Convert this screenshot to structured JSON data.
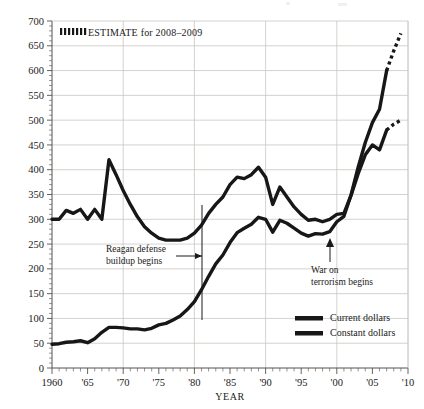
{
  "chart_data": {
    "type": "line",
    "title": "",
    "xlabel": "YEAR",
    "ylabel": "BILLIONS OF DOLLARS",
    "xlim": [
      1960,
      2010
    ],
    "ylim": [
      0,
      700
    ],
    "ytick_step": 50,
    "grid": true,
    "legend_position": "bottom-right",
    "yticks": [
      "0",
      "50",
      "100",
      "150",
      "200",
      "250",
      "300",
      "350",
      "400",
      "450",
      "500",
      "550",
      "600",
      "650",
      "700"
    ],
    "ytick_values": [
      0,
      50,
      100,
      150,
      200,
      250,
      300,
      350,
      400,
      450,
      500,
      550,
      600,
      650,
      700
    ],
    "xticks": [
      "1960",
      "'65",
      "'70",
      "'75",
      "'80",
      "'85",
      "'90",
      "'95",
      "'00",
      "'05",
      "'10"
    ],
    "xtick_values": [
      1960,
      1965,
      1970,
      1975,
      1980,
      1985,
      1990,
      1995,
      2000,
      2005,
      2010
    ],
    "series": [
      {
        "name": "Current dollars",
        "style": "solid",
        "x": [
          1960,
          1961,
          1962,
          1963,
          1964,
          1965,
          1966,
          1967,
          1968,
          1969,
          1970,
          1971,
          1972,
          1973,
          1974,
          1975,
          1976,
          1977,
          1978,
          1979,
          1980,
          1981,
          1982,
          1983,
          1984,
          1985,
          1986,
          1987,
          1988,
          1989,
          1990,
          1991,
          1992,
          1993,
          1994,
          1995,
          1996,
          1997,
          1998,
          1999,
          2000,
          2001,
          2002,
          2003,
          2004,
          2005,
          2006,
          2007
        ],
        "values": [
          48,
          49,
          52,
          53,
          55,
          51,
          59,
          72,
          82,
          82,
          81,
          79,
          79,
          77,
          80,
          87,
          90,
          97,
          105,
          118,
          134,
          158,
          185,
          210,
          228,
          253,
          273,
          282,
          290,
          304,
          300,
          274,
          298,
          292,
          282,
          272,
          266,
          271,
          270,
          275,
          295,
          306,
          349,
          405,
          455,
          495,
          522,
          600
        ]
      },
      {
        "name": "Current dollars estimate",
        "style": "dotted",
        "x": [
          2007,
          2008,
          2009
        ],
        "values": [
          600,
          640,
          675
        ]
      },
      {
        "name": "Constant dollars",
        "style": "solid",
        "x": [
          1960,
          1961,
          1962,
          1963,
          1964,
          1965,
          1966,
          1967,
          1968,
          1969,
          1970,
          1971,
          1972,
          1973,
          1974,
          1975,
          1976,
          1977,
          1978,
          1979,
          1980,
          1981,
          1982,
          1983,
          1984,
          1985,
          1986,
          1987,
          1988,
          1989,
          1990,
          1991,
          1992,
          1993,
          1994,
          1995,
          1996,
          1997,
          1998,
          1999,
          2000,
          2001,
          2002,
          2003,
          2004,
          2005,
          2006,
          2007
        ],
        "values": [
          300,
          300,
          318,
          312,
          320,
          300,
          320,
          300,
          420,
          390,
          358,
          330,
          305,
          285,
          272,
          262,
          258,
          258,
          258,
          262,
          272,
          288,
          312,
          330,
          345,
          370,
          385,
          382,
          390,
          405,
          385,
          330,
          365,
          345,
          325,
          310,
          298,
          300,
          295,
          300,
          310,
          312,
          348,
          392,
          430,
          450,
          440,
          480
        ]
      },
      {
        "name": "Constant dollars estimate",
        "style": "dotted",
        "x": [
          2007,
          2008,
          2009
        ],
        "values": [
          480,
          492,
          500
        ]
      }
    ],
    "annotations": [
      {
        "id": "reagan",
        "text_line1": "Reagan defense",
        "text_line2": "buildup begins",
        "year": 1981
      },
      {
        "id": "war-on-terror",
        "text_line1": "War on",
        "text_line2": "terrorism begins",
        "year": 2001
      }
    ],
    "estimate_note": "ESTIMATE for 2008–2009",
    "legend": [
      {
        "label": "Current dollars"
      },
      {
        "label": "Constant dollars"
      }
    ]
  },
  "colors": {
    "line": "#171717",
    "grid": "#c9c6c2",
    "axis": "#55524f",
    "text": "#1a1a1a",
    "background": "#ffffff"
  }
}
